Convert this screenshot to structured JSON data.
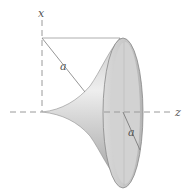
{
  "diagram": {
    "type": "surface-of-revolution",
    "labels": {
      "x_axis": "x",
      "z_axis": "z",
      "tractrix_segment": "a",
      "rim_radius": "a"
    },
    "colors": {
      "axis": "#9a9a9a",
      "surface_light": "#e6e6e6",
      "surface_dark": "#a8a8a8",
      "rim_inner": "#c8c8c8",
      "line": "#8a8a8a",
      "label": "#555555"
    }
  }
}
